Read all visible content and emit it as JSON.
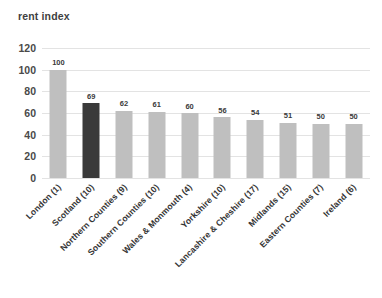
{
  "chart_data": {
    "type": "bar",
    "title": "rent index",
    "xlabel": "",
    "ylabel": "",
    "ylim": [
      0,
      120
    ],
    "yticks": [
      0,
      20,
      40,
      60,
      80,
      100,
      120
    ],
    "grid": "horizontal",
    "legend": "none",
    "categories": [
      "London (1)",
      "Scotland (10)",
      "Northern Counties (9)",
      "Southern Counties (10)",
      "Wales & Monmouth (4)",
      "Yorkshire (10)",
      "Lancashire & Cheshire (17)",
      "Midlands (15)",
      "Eastern Counties (7)",
      "Ireland (6)"
    ],
    "values": [
      100,
      69,
      62,
      61,
      60,
      56,
      54,
      51,
      50,
      50
    ],
    "highlighted_category": "Scotland (10)",
    "colors": {
      "bar_default": "#bfbfbf",
      "bar_highlight": "#3a3a3a",
      "gridline": "#e3e3e3",
      "text": "#3a3a3a",
      "axis_text": "#4a4a4a",
      "background": "#ffffff"
    }
  }
}
